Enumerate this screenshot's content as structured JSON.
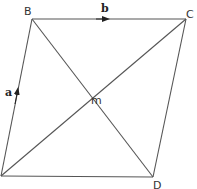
{
  "diagram": {
    "type": "parallelogram-vectors",
    "stroke_color": "#555555",
    "vertices": {
      "A": {
        "label": "",
        "x": 1,
        "y": 176
      },
      "B": {
        "label": "B",
        "x": 32,
        "y": 19
      },
      "C": {
        "label": "C",
        "x": 186,
        "y": 19
      },
      "D": {
        "label": "D",
        "x": 153,
        "y": 177
      }
    },
    "intersection": {
      "label": "m"
    },
    "vectors": {
      "a": {
        "label": "a",
        "from": "A",
        "to": "B"
      },
      "b": {
        "label": "b",
        "from": "B",
        "to": "C"
      }
    },
    "edges": [
      "AB",
      "BC",
      "CD",
      "DA"
    ],
    "diagonals": [
      "AC",
      "BD"
    ]
  }
}
